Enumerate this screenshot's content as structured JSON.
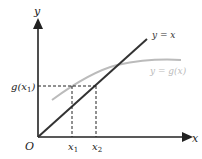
{
  "diagram": {
    "axes": {
      "x_label": "x",
      "y_label": "y",
      "origin_label": "O"
    },
    "ticks": {
      "x1": "x",
      "x1_sub": "1",
      "x2": "x",
      "x2_sub": "2",
      "gx1": "g(x",
      "gx1_sub": "1",
      "gx1_close": ")"
    },
    "curves": [
      {
        "name": "line",
        "label": "y = x",
        "color": "#333333"
      },
      {
        "name": "g",
        "label": "y = g(x)",
        "color": "#bbbbbb"
      }
    ]
  }
}
